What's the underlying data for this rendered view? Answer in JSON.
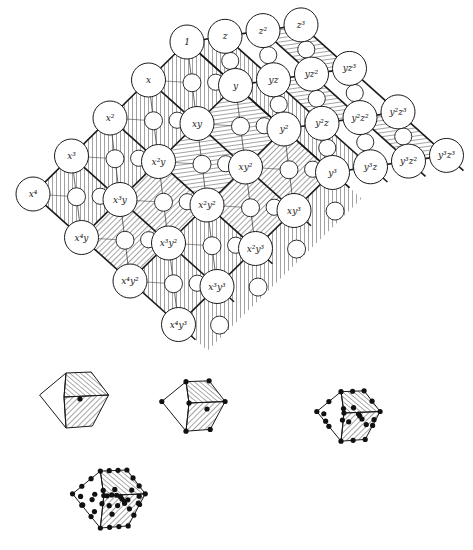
{
  "figure": {
    "type": "monomial lattice with Gröbner/zonotope subdivision",
    "lattice": {
      "origin": [
        187,
        42
      ],
      "vector_x": [
        -38.5,
        38
      ],
      "vector_y": [
        48.5,
        43.5
      ],
      "vector_z": [
        38,
        -5.7
      ],
      "large_radius": 17,
      "small_radius": 9
    },
    "nodes": [
      {
        "label": "1",
        "a": 0,
        "b": 0,
        "c": 0
      },
      {
        "label": "z",
        "a": 0,
        "b": 0,
        "c": 1
      },
      {
        "label": "z²",
        "a": 0,
        "b": 0,
        "c": 2
      },
      {
        "label": "z³",
        "a": 0,
        "b": 0,
        "c": 3
      },
      {
        "label": "x",
        "a": 1,
        "b": 0,
        "c": 0
      },
      {
        "label": "x²",
        "a": 2,
        "b": 0,
        "c": 0
      },
      {
        "label": "x³",
        "a": 3,
        "b": 0,
        "c": 0
      },
      {
        "label": "x⁴",
        "a": 4,
        "b": 0,
        "c": 0
      },
      {
        "label": "y",
        "a": 0,
        "b": 1,
        "c": 0
      },
      {
        "label": "yz",
        "a": 0,
        "b": 1,
        "c": 1
      },
      {
        "label": "yz²",
        "a": 0,
        "b": 1,
        "c": 2
      },
      {
        "label": "yz³",
        "a": 0,
        "b": 1,
        "c": 3
      },
      {
        "label": "y²",
        "a": 0,
        "b": 2,
        "c": 0
      },
      {
        "label": "y²z",
        "a": 0,
        "b": 2,
        "c": 1
      },
      {
        "label": "y²z²",
        "a": 0,
        "b": 2,
        "c": 2
      },
      {
        "label": "y²z³",
        "a": 0,
        "b": 2,
        "c": 3
      },
      {
        "label": "y³",
        "a": 0,
        "b": 3,
        "c": 0
      },
      {
        "label": "y³z",
        "a": 0,
        "b": 3,
        "c": 1
      },
      {
        "label": "y³z²",
        "a": 0,
        "b": 3,
        "c": 2
      },
      {
        "label": "y³z³",
        "a": 0,
        "b": 3,
        "c": 3
      },
      {
        "label": "xy",
        "a": 1,
        "b": 1,
        "c": 0
      },
      {
        "label": "xy²",
        "a": 1,
        "b": 2,
        "c": 0
      },
      {
        "label": "xy³",
        "a": 1,
        "b": 3,
        "c": 0
      },
      {
        "label": "x²y",
        "a": 2,
        "b": 1,
        "c": 0
      },
      {
        "label": "x²y²",
        "a": 2,
        "b": 2,
        "c": 0
      },
      {
        "label": "x²y³",
        "a": 2,
        "b": 3,
        "c": 0
      },
      {
        "label": "x³y",
        "a": 3,
        "b": 1,
        "c": 0
      },
      {
        "label": "x³y²",
        "a": 3,
        "b": 2,
        "c": 0
      },
      {
        "label": "x³y³",
        "a": 3,
        "b": 3,
        "c": 0
      },
      {
        "label": "x⁴y",
        "a": 4,
        "b": 1,
        "c": 0
      },
      {
        "label": "x⁴y²",
        "a": 4,
        "b": 2,
        "c": 0
      },
      {
        "label": "x⁴y³",
        "a": 4,
        "b": 3,
        "c": 0
      }
    ],
    "small_figures": [
      {
        "name": "zonotope-1",
        "center": [
          78,
          400
        ],
        "scale": 1.0,
        "dots": "center"
      },
      {
        "name": "zonotope-2",
        "center": [
          197,
          406
        ],
        "scale": 1.0,
        "dots": "vertices"
      },
      {
        "name": "zonotope-3",
        "center": [
          352,
          416
        ],
        "scale": 1.0,
        "dots": "dense"
      },
      {
        "name": "zonotope-4",
        "center": [
          113,
          499
        ],
        "scale": 1.15,
        "dots": "denser"
      }
    ],
    "colors": {
      "line": "#1a1a1a",
      "hatch": "#333333",
      "background": "#ffffff",
      "node_fill": "#ffffff"
    }
  }
}
